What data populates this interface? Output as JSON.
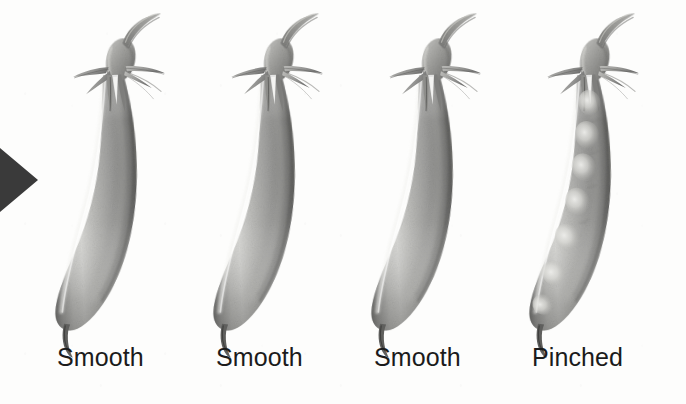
{
  "figure": {
    "background_color": "#fdfdfc",
    "ink_color": "#1b1b1b",
    "medium": "grayscale pencil botanical illustration",
    "pod_count": 4
  },
  "marker": {
    "name": "left-arrow-pointer",
    "shape": "right-pointing solid triangle",
    "color": "#3a3a3a",
    "x": 0,
    "y": 143,
    "width": 40,
    "height": 74
  },
  "pods": [
    {
      "index": 1,
      "label": "Smooth",
      "shape": "smooth",
      "has_visible_seeds": false,
      "seed_bumps": 0,
      "tip": "hooked point",
      "x": 45,
      "label_x": 57
    },
    {
      "index": 2,
      "label": "Smooth",
      "shape": "smooth",
      "has_visible_seeds": false,
      "seed_bumps": 0,
      "tip": "hooked point",
      "x": 203,
      "label_x": 216
    },
    {
      "index": 3,
      "label": "Smooth",
      "shape": "smooth",
      "has_visible_seeds": false,
      "seed_bumps": 0,
      "tip": "hooked point",
      "x": 361,
      "label_x": 374
    },
    {
      "index": 4,
      "label": "Pinched",
      "shape": "pinched",
      "has_visible_seeds": true,
      "seed_bumps": 6,
      "tip": "hooked point",
      "x": 519,
      "label_x": 532
    }
  ],
  "anatomy": {
    "stem": "peduncle curving up and to the right",
    "calyx": "bulbous receptacle",
    "sepals": "five slender pointed sepals",
    "body": "elongated curved pod",
    "tip": "small curled style point"
  },
  "colors": {
    "pod_light": "#e6e6e4",
    "pod_mid": "#a9a9a7",
    "pod_dark": "#6f6f6d",
    "pod_edge": "#4b4b49",
    "seed_highlight": "#dededa",
    "stem": "#8d8d8b",
    "marker": "#3a3a3a",
    "text": "#1b1b1b",
    "background": "#fdfdfc"
  }
}
